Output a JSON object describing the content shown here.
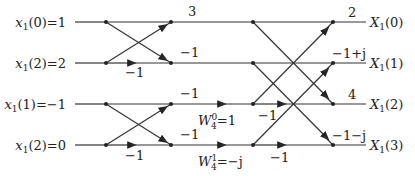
{
  "inputs": [
    {
      "var": "x",
      "sub": "1",
      "arg": "(0)",
      "value": "=1"
    },
    {
      "var": "x",
      "sub": "1",
      "arg": "(2)",
      "value": "=2"
    },
    {
      "var": "x",
      "sub": "1",
      "arg": "(1)",
      "value": "=−1"
    },
    {
      "var": "x",
      "sub": "1",
      "arg": "(2)",
      "value": "=0"
    }
  ],
  "outputs": [
    {
      "var": "X",
      "sub": "1",
      "arg": "(0)"
    },
    {
      "var": "X",
      "sub": "1",
      "arg": "(1)"
    },
    {
      "var": "X",
      "sub": "1",
      "arg": "(2)"
    },
    {
      "var": "X",
      "sub": "1",
      "arg": "(3)"
    }
  ],
  "stage1": {
    "multipliers": [
      "−1",
      "−1"
    ],
    "intermediate_values": [
      "3",
      "−1",
      "−1",
      "−1"
    ]
  },
  "twiddles": [
    {
      "w": "W",
      "sup": "0",
      "sub": "4",
      "value": "=1"
    },
    {
      "w": "W",
      "sup": "1",
      "sub": "4",
      "value": "=−j"
    }
  ],
  "stage2": {
    "multipliers": [
      "−1",
      "−1"
    ],
    "result_values": [
      "2",
      "−1+j",
      "4",
      "−1−j"
    ]
  }
}
